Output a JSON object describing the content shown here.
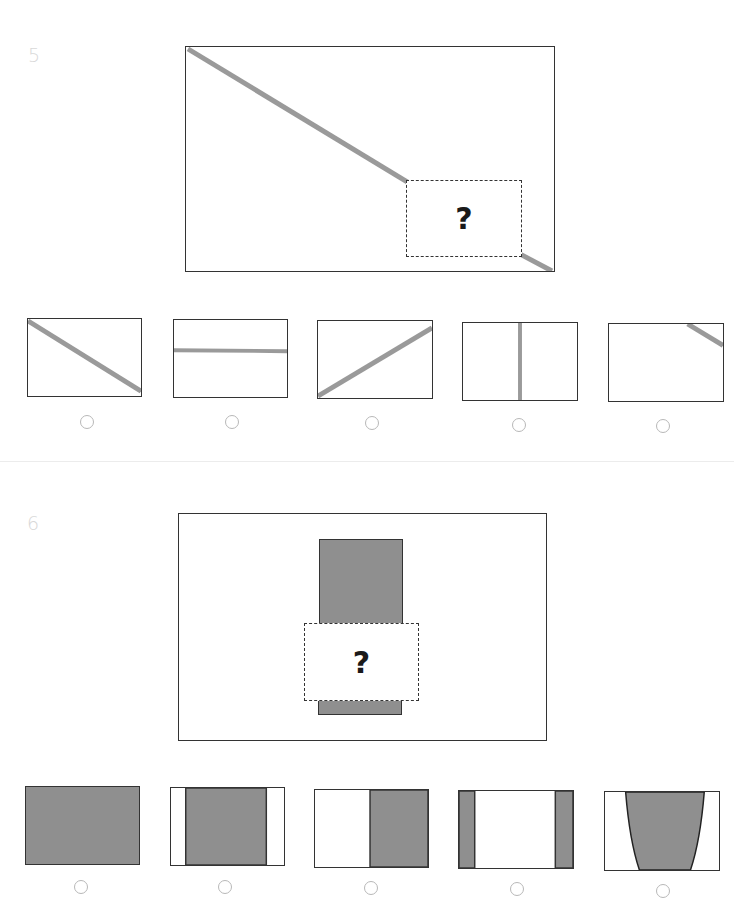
{
  "colors": {
    "line_gray": "#9a9a9a",
    "fill_gray": "#8f8f8f",
    "border": "#333333",
    "radio_border": "#b8b8b8",
    "question_number": "#d8d8d8"
  },
  "questions": [
    {
      "number": "5",
      "question_mark": "?",
      "options": [
        {
          "id": "5a",
          "icon": "diagonal-down-line",
          "selected": false
        },
        {
          "id": "5b",
          "icon": "horizontal-line",
          "selected": false
        },
        {
          "id": "5c",
          "icon": "diagonal-up-line",
          "selected": false
        },
        {
          "id": "5d",
          "icon": "vertical-line",
          "selected": false
        },
        {
          "id": "5e",
          "icon": "corner-segment-line",
          "selected": false
        }
      ]
    },
    {
      "number": "6",
      "question_mark": "?",
      "options": [
        {
          "id": "6a",
          "icon": "full-fill",
          "selected": false
        },
        {
          "id": "6b",
          "icon": "center-fill-band",
          "selected": false
        },
        {
          "id": "6c",
          "icon": "right-half-fill",
          "selected": false
        },
        {
          "id": "6d",
          "icon": "side-bars-fill",
          "selected": false
        },
        {
          "id": "6e",
          "icon": "tapered-fill",
          "selected": false
        }
      ]
    }
  ]
}
